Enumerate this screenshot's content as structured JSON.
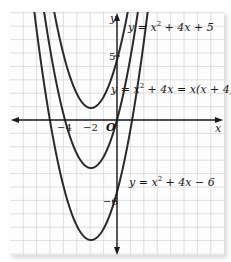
{
  "chart_data": {
    "type": "line",
    "title": "",
    "xlabel": "x",
    "ylabel": "y",
    "origin_label": "O",
    "x_tick_labels": [
      {
        "value": -4,
        "label": "−4"
      },
      {
        "value": -2,
        "label": "−2"
      }
    ],
    "y_tick_labels": [
      {
        "value": 5,
        "label": "5"
      },
      {
        "value": -6,
        "label": "−6"
      }
    ],
    "xlim": [
      -8,
      8
    ],
    "ylim": [
      -11,
      9
    ],
    "grid": true,
    "series": [
      {
        "name": "y = x^2 + 4x + 5",
        "label": "y = x² + 4x + 5",
        "equation": {
          "a": 1,
          "b": 4,
          "c": 5
        },
        "vertex": [
          -2,
          1
        ],
        "y_intercept": 5,
        "points": [
          [
            -5,
            10
          ],
          [
            -4,
            5
          ],
          [
            -3,
            2
          ],
          [
            -2,
            1
          ],
          [
            -1,
            2
          ],
          [
            0,
            5
          ],
          [
            1,
            10
          ]
        ]
      },
      {
        "name": "y = x^2 + 4x = x(x + 4)",
        "label": "y = x² + 4x = x(x + 4)",
        "equation": {
          "a": 1,
          "b": 4,
          "c": 0
        },
        "vertex": [
          -2,
          -4
        ],
        "x_intercepts": [
          -4,
          0
        ],
        "points": [
          [
            -6,
            12
          ],
          [
            -5,
            5
          ],
          [
            -4,
            0
          ],
          [
            -3,
            -3
          ],
          [
            -2,
            -4
          ],
          [
            -1,
            -3
          ],
          [
            0,
            0
          ],
          [
            1,
            5
          ],
          [
            2,
            12
          ]
        ]
      },
      {
        "name": "y = x^2 + 4x - 6",
        "label": "y = x² + 4x − 6",
        "equation": {
          "a": 1,
          "b": 4,
          "c": -6
        },
        "vertex": [
          -2,
          -10
        ],
        "y_intercept": -6,
        "points": [
          [
            -6,
            6
          ],
          [
            -5,
            -1
          ],
          [
            -4,
            -6
          ],
          [
            -3,
            -9
          ],
          [
            -2,
            -10
          ],
          [
            -1,
            -9
          ],
          [
            0,
            -6
          ],
          [
            1,
            -1
          ],
          [
            2,
            6
          ]
        ]
      }
    ],
    "annotations": [
      {
        "text": "y = x² + 4x + 5",
        "near": "top parabola"
      },
      {
        "text": "y = x² + 4x = x(x + 4)",
        "near": "middle parabola"
      },
      {
        "text": "y = x² + 4x − 6",
        "near": "bottom parabola"
      }
    ]
  },
  "labels": {
    "x_axis": "x",
    "y_axis": "y",
    "origin": "O",
    "tick_neg4": "−4",
    "tick_neg2": "−2",
    "tick_5": "5",
    "tick_neg6": "−6",
    "eq1_prefix": "y = x",
    "eq1_sup": "2",
    "eq1_suffix": " + 4x + 5",
    "eq2_prefix": "y = x",
    "eq2_sup": "2",
    "eq2_suffix": " + 4x = x(x + 4)",
    "eq3_prefix": "y = x",
    "eq3_sup": "2",
    "eq3_suffix": " + 4x − 6"
  },
  "colors": {
    "curve": "#2b2b2b",
    "grid": "#d6d6d6",
    "axis": "#1a1a1a",
    "frame": "#fdfdfd"
  }
}
